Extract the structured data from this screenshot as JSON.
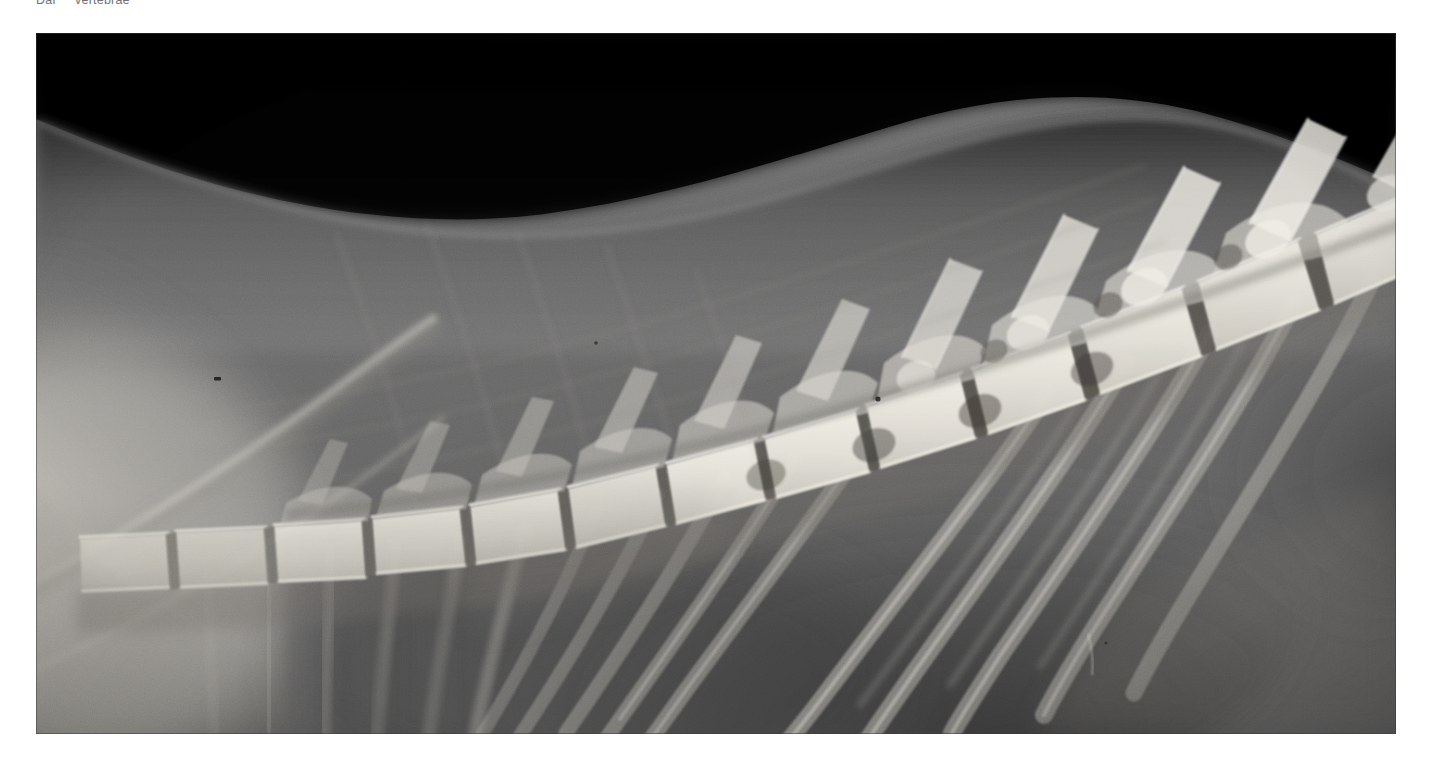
{
  "page": {
    "background_color": "#ffffff",
    "width": 1432,
    "height": 762
  },
  "caption": {
    "text": "Dar     vertebrae",
    "color": "#4a4a52",
    "clipped_at_top": true
  },
  "figure": {
    "name": "lateral-thoracic-spine-radiograph",
    "modality": "radiograph",
    "projection": "lateral",
    "frame": {
      "x": 36,
      "y": 33,
      "width": 1360,
      "height": 701
    },
    "palette": {
      "background_air": "#050505",
      "soft_tissue_dark": "#3a3a3a",
      "soft_tissue_mid": "#6e6e6e",
      "soft_tissue_light": "#9a9a9a",
      "bone_cortex": "#d8d6d0",
      "bone_bright": "#efece4",
      "lung_field": "#4b4b4b",
      "scapula_bright": "#e6e3db"
    },
    "anatomy_labels": [
      "vertebral body",
      "intervertebral disc space",
      "spinous process",
      "articular process",
      "rib head",
      "rib shaft",
      "scapular spine",
      "dorsal body wall",
      "lung field"
    ],
    "structures": {
      "vertebral_bodies_visible": 13,
      "spine_curve_description": "caudoventral-to-craniodorsal sweep, lowest at left-centre, rising to upper right"
    }
  }
}
